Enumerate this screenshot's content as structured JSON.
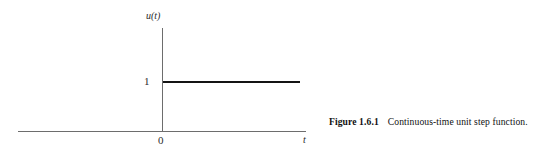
{
  "figure": {
    "caption": {
      "number": "Figure 1.6.1",
      "text": "Continuous-time unit step function."
    },
    "axes": {
      "y_label": "u(t)",
      "x_label": "t",
      "origin_label": "0",
      "y_tick_label": "1"
    },
    "colors": {
      "axis": "#6d6d6d",
      "trace": "#141414",
      "background": "#ffffff",
      "text": "#111111"
    }
  },
  "chart_data": {
    "type": "line",
    "title": "Continuous-time unit step function",
    "xlabel": "t",
    "ylabel": "u(t)",
    "xlim": [
      -5,
      5
    ],
    "ylim": [
      0,
      1.45
    ],
    "grid": false,
    "legend": null,
    "xticks": [
      0
    ],
    "xticklabels": [
      "0"
    ],
    "yticks": [
      1
    ],
    "yticklabels": [
      "1"
    ],
    "annotations": [],
    "series": [
      {
        "name": "u(t)",
        "x": [
          -5,
          0,
          0,
          5
        ],
        "y": [
          0,
          0,
          1,
          1
        ],
        "color": "#141414",
        "linewidth": 2
      }
    ]
  }
}
